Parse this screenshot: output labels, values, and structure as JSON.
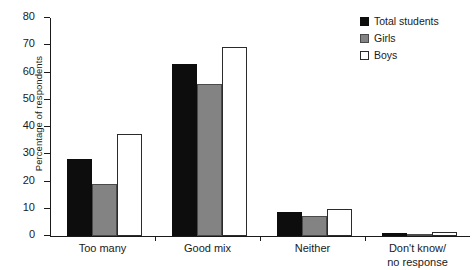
{
  "chart_data": {
    "type": "bar",
    "title": "",
    "xlabel": "",
    "ylabel": "Percentage of respondents",
    "ylim": [
      0,
      80
    ],
    "yticks": [
      0,
      10,
      20,
      30,
      40,
      50,
      60,
      70,
      80
    ],
    "ytick_labels": [
      "0",
      "10",
      "20",
      "30",
      "40",
      "50",
      "60",
      "70",
      "80"
    ],
    "grid": false,
    "legend_position": "top-right",
    "categories": [
      "Too many",
      "Good mix",
      "Neither",
      "Don't know/\nno response"
    ],
    "category_lines": [
      [
        "Too many"
      ],
      [
        "Good mix"
      ],
      [
        "Neither"
      ],
      [
        "Don't know/",
        "no response"
      ]
    ],
    "series": [
      {
        "name": "Total students",
        "color": "#0d0d0d",
        "values": [
          28.3,
          63.0,
          8.7,
          1.0
        ]
      },
      {
        "name": "Girls",
        "color": "#838383",
        "values": [
          19.2,
          55.8,
          7.4,
          0.3
        ]
      },
      {
        "name": "Boys",
        "color": "#ffffff",
        "values": [
          37.4,
          69.2,
          10.0,
          1.4
        ]
      }
    ]
  },
  "legend": {
    "items": [
      {
        "label": "Total students",
        "swatch": "legend-swatch-total-students"
      },
      {
        "label": "Girls",
        "swatch": "legend-swatch-girls"
      },
      {
        "label": "Boys",
        "swatch": "legend-swatch-boys"
      }
    ]
  }
}
